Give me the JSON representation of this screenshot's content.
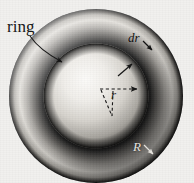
{
  "figure": {
    "name": "ring-annulus-diagram",
    "type": "physics-geometry-diagram",
    "background_color": "#f1f0ee",
    "width": 194,
    "height": 183
  },
  "geometry": {
    "center": {
      "x": 96,
      "y": 96
    },
    "outer_radius": 87,
    "inner_radius": 52,
    "ring_band_width": 35,
    "ring_fill_dark": "#0a0a0a",
    "ring_fill_light": "#e8e6e2",
    "disc_fill_light": "#f2f0ec",
    "disc_fill_dark": "#1a1a1a"
  },
  "labels": {
    "ring": "ring",
    "dr": "dr",
    "r": "r",
    "R": "R"
  },
  "annotations": [
    {
      "name": "ring-leader-arrow",
      "from_label": "ring",
      "description": "curved leader line from the word ring to the outer annulus band"
    },
    {
      "name": "dr-arrow-outer",
      "from_label": "dr",
      "description": "short arrow from dr pointing down-right to the outer edge of the ring"
    },
    {
      "name": "dr-arrow-inner",
      "from_label": "dr",
      "description": "short arrow pointing up-right from the inner disc toward the ring band"
    },
    {
      "name": "radius-r-arrow",
      "from_label": "r",
      "description": "dashed horizontal arrow from the center pointing right, marking radius r"
    },
    {
      "name": "radius-dashed-wedge",
      "description": "dashed lines forming a wedge below the center"
    },
    {
      "name": "radius-R-arrow",
      "from_label": "R",
      "description": "short arrow near R pointing down-right to the outer boundary"
    }
  ]
}
